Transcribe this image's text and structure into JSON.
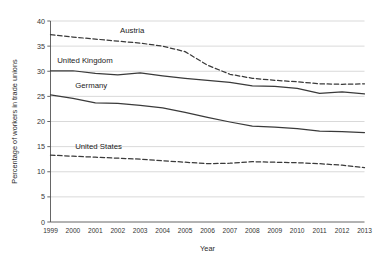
{
  "chart_data": {
    "type": "line",
    "title": "",
    "xlabel": "Year",
    "ylabel": "Percentage of workers in trade unions",
    "categories": [
      1999,
      2000,
      2001,
      2002,
      2003,
      2004,
      2005,
      2006,
      2007,
      2008,
      2009,
      2010,
      2011,
      2012,
      2013
    ],
    "xlim": [
      1999,
      2013
    ],
    "ylim": [
      0,
      40
    ],
    "yticks": [
      0,
      5,
      10,
      15,
      20,
      25,
      30,
      35,
      40
    ],
    "xticks": [
      "1999",
      "2000",
      "2001",
      "2002",
      "2003",
      "2004",
      "2005",
      "2006",
      "2007",
      "2008",
      "2009",
      "2010",
      "2011",
      "2012",
      "2013"
    ],
    "grid": "horizontal",
    "legend_position": "inline-labels",
    "series": [
      {
        "name": "Austria",
        "style": "dashed",
        "color": "#3a3a3a",
        "label_x": 2002.1,
        "label_y": 37.6,
        "values": [
          37.3,
          36.8,
          36.4,
          36.0,
          35.6,
          35.0,
          33.9,
          31.2,
          29.4,
          28.6,
          28.2,
          27.9,
          27.5,
          27.4,
          27.5
        ]
      },
      {
        "name": "United Kingdom",
        "style": "solid",
        "color": "#3a3a3a",
        "label_x": 1999.3,
        "label_y": 31.6,
        "values": [
          30.1,
          30.1,
          29.6,
          29.3,
          29.7,
          29.1,
          28.6,
          28.2,
          27.8,
          27.1,
          27.0,
          26.6,
          25.6,
          25.9,
          25.5
        ]
      },
      {
        "name": "Germany",
        "style": "solid",
        "color": "#3a3a3a",
        "label_x": 2000.1,
        "label_y": 26.6,
        "values": [
          25.3,
          24.6,
          23.7,
          23.6,
          23.2,
          22.7,
          21.8,
          20.8,
          19.9,
          19.1,
          18.9,
          18.6,
          18.1,
          18.0,
          17.8
        ]
      },
      {
        "name": "United States",
        "style": "dashed",
        "color": "#3a3a3a",
        "label_x": 2000.1,
        "label_y": 14.6,
        "values": [
          13.3,
          13.1,
          12.9,
          12.7,
          12.5,
          12.2,
          11.9,
          11.6,
          11.7,
          12.0,
          11.9,
          11.8,
          11.6,
          11.3,
          10.8
        ]
      }
    ]
  }
}
